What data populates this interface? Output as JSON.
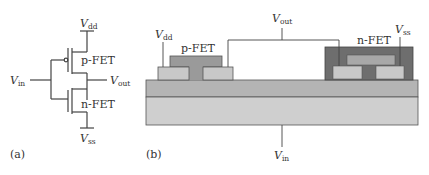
{
  "panel_a": {
    "caption": "(a)",
    "vdd": {
      "main": "V",
      "sub": "dd"
    },
    "vss": {
      "main": "V",
      "sub": "ss"
    },
    "vin": {
      "main": "V",
      "sub": "in"
    },
    "vout": {
      "main": "V",
      "sub": "out"
    },
    "pfet_label": "p-FET",
    "nfet_label": "n-FET"
  },
  "panel_b": {
    "caption": "(b)",
    "vdd": {
      "main": "V",
      "sub": "dd"
    },
    "vss": {
      "main": "V",
      "sub": "ss"
    },
    "vin": {
      "main": "V",
      "sub": "in"
    },
    "vout": {
      "main": "V",
      "sub": "out"
    },
    "pfet_label": "p-FET",
    "nfet_label": "n-FET"
  },
  "colors": {
    "line": "#444444",
    "substrate_bottom": "#cfcfcf",
    "substrate_top": "#b4b4b4",
    "contact": "#c8c8c8",
    "gate": "#9a9a9a",
    "encapsulation": "#6e6e6e",
    "nfet_gate": "#a8a8a8"
  }
}
